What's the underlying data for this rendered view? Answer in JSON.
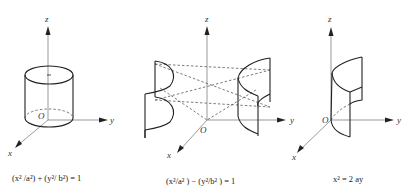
{
  "figures": [
    {
      "id": "elliptic-cylinder",
      "shape": "elliptic cylinder",
      "axes": {
        "z": "z",
        "y": "y",
        "x": "x",
        "origin": "O"
      },
      "caption": "(x² /a²) + (y²/ b²) = 1"
    },
    {
      "id": "hyperbolic-cylinder",
      "shape": "hyperbolic cylinder",
      "axes": {
        "z": "z",
        "y": "y",
        "x": "x",
        "origin": "O"
      },
      "caption": "(x²/a² ) − (y²/b² ) = 1"
    },
    {
      "id": "parabolic-cylinder",
      "shape": "parabolic cylinder",
      "axes": {
        "z": "z",
        "y": "y",
        "x": "x",
        "origin": "O"
      },
      "caption": "x² = 2 ay"
    }
  ],
  "colors": {
    "line": "#222222",
    "axis": "#555555",
    "background": "#ffffff"
  }
}
